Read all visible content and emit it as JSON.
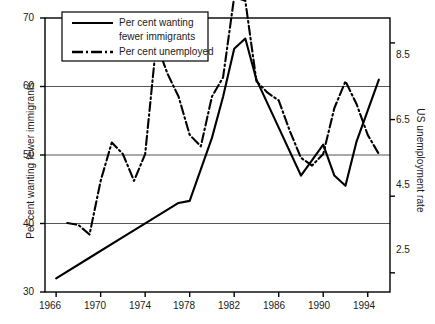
{
  "chart_data": {
    "type": "line",
    "title": "",
    "xlabel": "",
    "ylabel": "Per cent wanting fewer immigrants",
    "ylabel_right": "US unemployment rate",
    "xlim": [
      1965,
      1996
    ],
    "ylim": [
      30,
      70
    ],
    "ylim_right": [
      2.0,
      9.15
    ],
    "grid": "horizontal",
    "legend_position": "top-left-inside",
    "xticks": [
      1966,
      1970,
      1974,
      1978,
      1982,
      1986,
      1990,
      1994
    ],
    "xtick_labels": [
      "1966",
      "1970",
      "1974",
      "1978",
      "1982",
      "1986",
      "1990",
      "1994"
    ],
    "yticks": [
      30,
      40,
      50,
      60,
      70
    ],
    "ytick_labels": [
      "30",
      "40",
      "50",
      "60",
      "70"
    ],
    "yticks_right": [
      2.5,
      4.5,
      6.5,
      8.5
    ],
    "ytick_labels_right": [
      "2.5",
      "4.5",
      "6.5",
      "8.5"
    ],
    "series": [
      {
        "name": "Per cent wanting fewer immigrants",
        "axis": "left",
        "style": "solid",
        "color": "#000000",
        "x": [
          1966,
          1969,
          1972,
          1977,
          1978,
          1980,
          1981,
          1982,
          1983,
          1984,
          1986,
          1988,
          1990,
          1991,
          1992,
          1993,
          1995
        ],
        "y": [
          32.0,
          35.0,
          38.0,
          43.0,
          43.3,
          52.5,
          58.5,
          65.5,
          67.0,
          61.0,
          54.0,
          47.0,
          51.5,
          47.0,
          45.5,
          52.0,
          61.0
        ]
      },
      {
        "name": "Per cent unemployed",
        "axis": "right",
        "style": "dash-dot",
        "color": "#000000",
        "x": [
          1967,
          1968,
          1969,
          1970,
          1971,
          1972,
          1973,
          1974,
          1975,
          1976,
          1977,
          1978,
          1979,
          1980,
          1981,
          1982,
          1983,
          1984,
          1985,
          1986,
          1987,
          1988,
          1989,
          1990,
          1991,
          1992,
          1993,
          1994,
          1995
        ],
        "y": [
          3.8,
          3.75,
          3.5,
          4.9,
          5.9,
          5.6,
          4.9,
          5.6,
          8.5,
          7.7,
          7.1,
          6.1,
          5.8,
          7.1,
          7.6,
          9.7,
          9.6,
          7.5,
          7.2,
          7.0,
          6.2,
          5.5,
          5.3,
          5.6,
          6.8,
          7.5,
          6.9,
          6.1,
          5.6
        ]
      }
    ]
  },
  "legend": {
    "entries": [
      {
        "label_line1": "Per cent wanting",
        "label_line2": "fewer immigrants",
        "style": "solid"
      },
      {
        "label_line1": "Per cent unemployed",
        "label_line2": "",
        "style": "dash-dot"
      }
    ]
  }
}
